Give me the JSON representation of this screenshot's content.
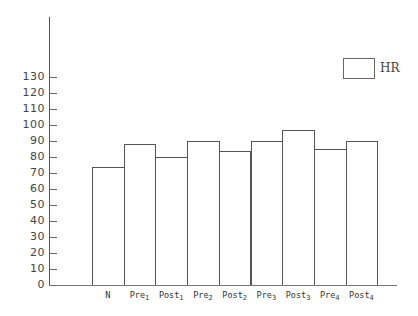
{
  "chart_data": {
    "type": "bar",
    "title": "",
    "xlabel": "",
    "ylabel": "",
    "categories": [
      "N",
      "Pre1",
      "Post1",
      "Pre2",
      "Post2",
      "Pre3",
      "Post3",
      "Pre4",
      "Post4"
    ],
    "category_labels": [
      {
        "base": "N",
        "sub": ""
      },
      {
        "base": "Pre",
        "sub": "1"
      },
      {
        "base": "Post",
        "sub": "1"
      },
      {
        "base": "Pre",
        "sub": "2"
      },
      {
        "base": "Post",
        "sub": "2"
      },
      {
        "base": "Pre",
        "sub": "3"
      },
      {
        "base": "Post",
        "sub": "3"
      },
      {
        "base": "Pre",
        "sub": "4"
      },
      {
        "base": "Post",
        "sub": "4"
      }
    ],
    "series": [
      {
        "name": "HR",
        "values": [
          74,
          88,
          80,
          90,
          84,
          90,
          97,
          85,
          90
        ]
      }
    ],
    "yticks": [
      0,
      10,
      20,
      30,
      40,
      50,
      60,
      70,
      80,
      90,
      100,
      110,
      120,
      130
    ],
    "ylim": [
      0,
      130
    ],
    "grid": false,
    "legend": {
      "position": "top-right",
      "entries": [
        "HR"
      ]
    }
  }
}
